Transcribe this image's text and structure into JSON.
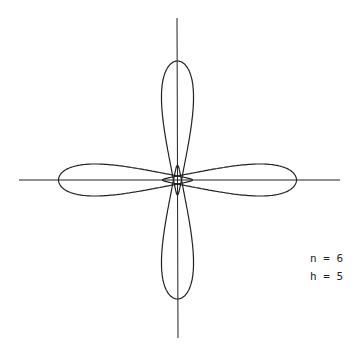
{
  "figure": {
    "type": "polar curve with four lobes",
    "parameters": [
      {
        "label": "n = 6"
      },
      {
        "label": "h = 5"
      }
    ],
    "colors": {
      "stroke": "#222222",
      "background": "#ffffff"
    }
  }
}
